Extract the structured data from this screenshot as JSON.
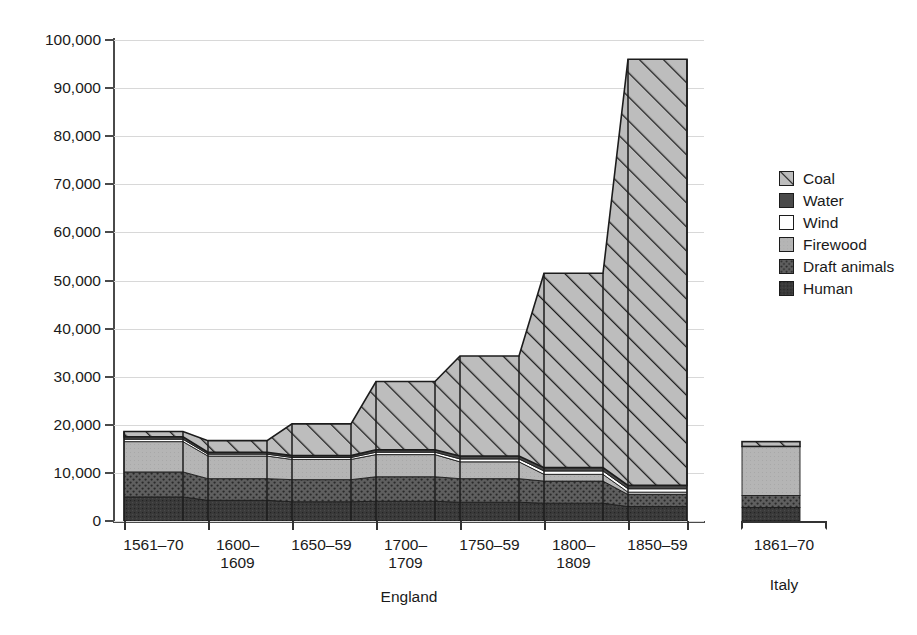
{
  "chart_data": {
    "type": "area",
    "subtype": "stacked-stepped-area",
    "title": "",
    "xlabel": "",
    "ylabel": "",
    "ylim": [
      0,
      100000
    ],
    "ytick_values": [
      0,
      10000,
      20000,
      30000,
      40000,
      50000,
      60000,
      70000,
      80000,
      90000,
      100000
    ],
    "ytick_labels": [
      "0",
      "10,000",
      "20,000",
      "30,000",
      "40,000",
      "50,000",
      "60,000",
      "70,000",
      "80,000",
      "90,000",
      "100,000"
    ],
    "grid": true,
    "legend_position": "right",
    "groups": [
      {
        "name": "England",
        "label": "England"
      },
      {
        "name": "Italy",
        "label": "Italy"
      }
    ],
    "categories": [
      "1561-70",
      "1600-\n1609",
      "1650-59",
      "1700-\n1709",
      "1750-59",
      "1800-\n1809",
      "1850-59"
    ],
    "categories_flat": [
      "1561-70",
      "1600-1609",
      "1650-59",
      "1700-1709",
      "1750-59",
      "1800-1809",
      "1850-59"
    ],
    "italy_categories": [
      "1861-70"
    ],
    "series": [
      {
        "name": "Human",
        "color": "#3a3a3a",
        "pattern": "solid-dark",
        "values": [
          5000,
          4300,
          4000,
          4100,
          3900,
          3700,
          3000
        ],
        "italy_values": [
          2800
        ]
      },
      {
        "name": "Draft animals",
        "color": "#5f5f5f",
        "pattern": "dots",
        "values": [
          5200,
          4500,
          4600,
          5100,
          4900,
          4600,
          2500
        ],
        "italy_values": [
          2500
        ]
      },
      {
        "name": "Firewood",
        "color": "#b5b5b5",
        "pattern": "solid-light",
        "values": [
          6300,
          4700,
          4200,
          4600,
          3500,
          1400,
          500
        ],
        "italy_values": [
          10200
        ]
      },
      {
        "name": "Wind",
        "color": "#ffffff",
        "pattern": "white",
        "values": [
          500,
          400,
          400,
          500,
          600,
          700,
          700
        ],
        "italy_values": [
          0
        ]
      },
      {
        "name": "Water",
        "color": "#4a4a4a",
        "pattern": "solid-mid",
        "values": [
          500,
          400,
          400,
          500,
          600,
          700,
          700
        ],
        "italy_values": [
          0
        ]
      },
      {
        "name": "Coal",
        "color": "#bdbdbd",
        "pattern": "hatch",
        "values": [
          1100,
          2400,
          6600,
          14200,
          20800,
          40400,
          88600
        ],
        "italy_values": [
          1000
        ]
      }
    ],
    "stack_order_bottom_to_top": [
      "Human",
      "Draft animals",
      "Firewood",
      "Wind",
      "Water",
      "Coal"
    ],
    "totals": [
      18600,
      16700,
      20200,
      29000,
      34300,
      51500,
      96000
    ],
    "italy_total": 16500
  },
  "legend": {
    "items": [
      {
        "label": "Coal",
        "swatch": "hatch"
      },
      {
        "label": "Water",
        "swatch": "solid-mid"
      },
      {
        "label": "Wind",
        "swatch": "white"
      },
      {
        "label": "Firewood",
        "swatch": "solid-light"
      },
      {
        "label": "Draft animals",
        "swatch": "dots"
      },
      {
        "label": "Human",
        "swatch": "solid-dark"
      }
    ]
  },
  "axes": {
    "y_labels": [
      "100,000",
      "90,000",
      "80,000",
      "70,000",
      "60,000",
      "50,000",
      "40,000",
      "30,000",
      "20,000",
      "10,000",
      "0"
    ],
    "x_labels_england": [
      "1561-70",
      "1600-\n1609",
      "1650-59",
      "1700-\n1709",
      "1750-59",
      "1800-\n1809",
      "1850-59"
    ],
    "x_label_italy": "1861-70",
    "group_label_england": "England",
    "group_label_italy": "Italy"
  },
  "colors": {
    "human": "#3a3a3a",
    "draft_animals": "#5f5f5f",
    "firewood": "#b5b5b5",
    "wind": "#ffffff",
    "water": "#4a4a4a",
    "coal": "#bdbdbd",
    "outline": "#1c1c1c",
    "gridline": "#d8d8d8",
    "axis": "#4a4a4a",
    "text": "#1a1a1a",
    "background": "#ffffff"
  }
}
